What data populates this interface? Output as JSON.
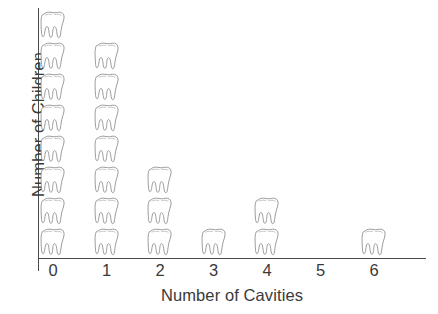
{
  "chart_data": {
    "type": "bar",
    "subtype": "pictograph",
    "title": "",
    "xlabel": "Number of Cavities",
    "ylabel": "Number of Children",
    "categories": [
      "0",
      "1",
      "2",
      "3",
      "4",
      "5",
      "6"
    ],
    "values": [
      8,
      7,
      3,
      1,
      2,
      0,
      1
    ],
    "icon": "tooth-icon",
    "icon_unit_value": 1,
    "grid": false,
    "legend": null,
    "ylim": [
      0,
      8
    ],
    "axis_color": "#4a4a4a",
    "icon_color": "#6e6e6e",
    "text_color": "#3a3a3a",
    "background": "#ffffff"
  },
  "axes": {
    "x_title": "Number of Cavities",
    "y_title": "Number of Children",
    "x_ticks": [
      "0",
      "1",
      "2",
      "3",
      "4",
      "5",
      "6"
    ]
  }
}
